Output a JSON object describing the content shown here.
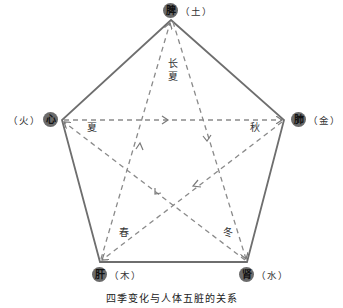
{
  "diagram": {
    "caption": "四季变化与人体五脏的关系",
    "organs": {
      "spleen": {
        "label": "脾",
        "element": "（土）"
      },
      "heart": {
        "label": "心",
        "element": "（火）"
      },
      "lung": {
        "label": "肺",
        "element": "（金）"
      },
      "liver": {
        "label": "肝",
        "element": "（木）"
      },
      "kidney": {
        "label": "肾",
        "element": "（水）"
      }
    },
    "seasons": {
      "late_summer_1": "长",
      "late_summer_2": "夏",
      "summer": "夏",
      "autumn": "秋",
      "spring": "春",
      "winter": "冬"
    },
    "colors": {
      "pentagon_stroke": "#6e6e6e",
      "dashed_stroke": "#8a8a8a",
      "badge_fill": "#6b6b6b"
    },
    "cycle": [
      "肝→心 (春)",
      "心→肺 (夏)",
      "肺→肾 (秋)",
      "肾→脾 (冬)",
      "脾→肝 (长夏)"
    ]
  }
}
